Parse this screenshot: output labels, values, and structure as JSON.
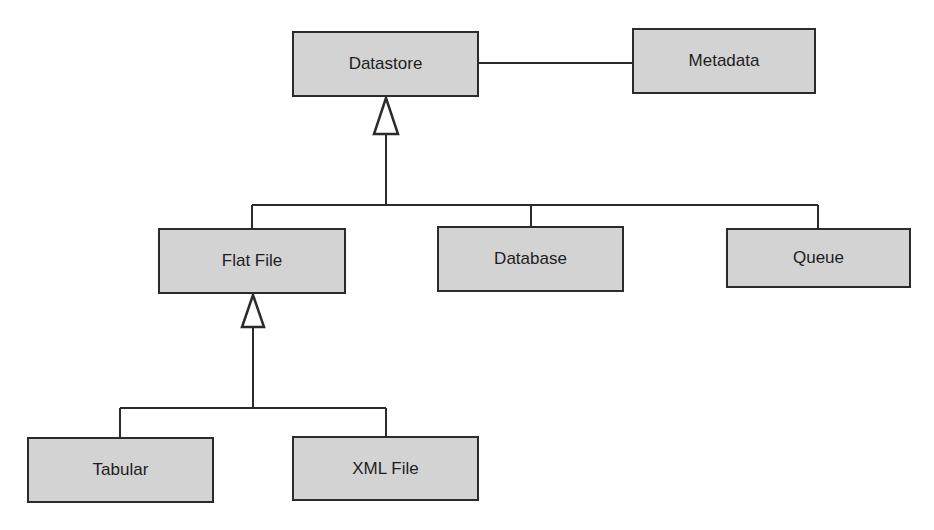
{
  "diagram": {
    "type": "uml-class-hierarchy",
    "colors": {
      "box_fill": "#d3d3d3",
      "stroke": "#2b2b2b",
      "text": "#1e1e1e",
      "background": "#ffffff"
    },
    "nodes": [
      {
        "id": "datastore",
        "label": "Datastore",
        "x": 292,
        "y": 31,
        "w": 187,
        "h": 66
      },
      {
        "id": "metadata",
        "label": "Metadata",
        "x": 632,
        "y": 28,
        "w": 184,
        "h": 66
      },
      {
        "id": "flatfile",
        "label": "Flat File",
        "x": 158,
        "y": 228,
        "w": 188,
        "h": 66
      },
      {
        "id": "database",
        "label": "Database",
        "x": 437,
        "y": 226,
        "w": 187,
        "h": 66
      },
      {
        "id": "queue",
        "label": "Queue",
        "x": 726,
        "y": 228,
        "w": 185,
        "h": 60
      },
      {
        "id": "tabular",
        "label": "Tabular",
        "x": 27,
        "y": 437,
        "w": 187,
        "h": 66
      },
      {
        "id": "xmlfile",
        "label": "XML File",
        "x": 292,
        "y": 436,
        "w": 187,
        "h": 65
      }
    ],
    "edges": [
      {
        "from": "datastore",
        "to": "metadata",
        "kind": "association"
      },
      {
        "from": "flatfile",
        "to": "datastore",
        "kind": "generalization"
      },
      {
        "from": "database",
        "to": "datastore",
        "kind": "generalization"
      },
      {
        "from": "queue",
        "to": "datastore",
        "kind": "generalization"
      },
      {
        "from": "tabular",
        "to": "flatfile",
        "kind": "generalization"
      },
      {
        "from": "xmlfile",
        "to": "flatfile",
        "kind": "generalization"
      }
    ]
  }
}
